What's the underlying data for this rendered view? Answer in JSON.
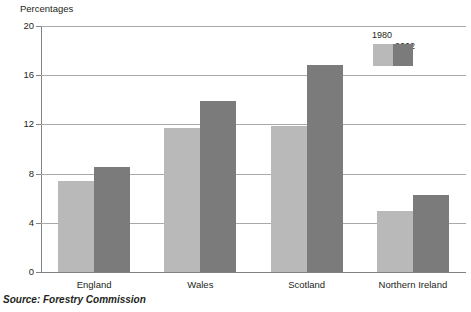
{
  "chart_data": {
    "type": "bar",
    "title": "",
    "subtitle": "",
    "axis_title": "Percentages",
    "xlabel": "",
    "ylabel": "Percentages",
    "ylim": [
      0,
      20
    ],
    "yticks": [
      0,
      4,
      8,
      12,
      16,
      20
    ],
    "ytick_labels": [
      "0",
      "4",
      "8",
      "12",
      "16",
      "20"
    ],
    "grid": true,
    "legend_position": "top-right",
    "categories": [
      "England",
      "Wales",
      "Scotland",
      "Northern Ireland"
    ],
    "series": [
      {
        "name": "1980",
        "color": "#b9b9b9",
        "values": [
          7.4,
          11.7,
          11.9,
          5.0
        ]
      },
      {
        "name": "2002",
        "color": "#7b7b7b",
        "values": [
          8.5,
          13.9,
          16.8,
          6.3
        ]
      }
    ],
    "source": "Source: Forestry Commission"
  },
  "colors": {
    "series_1980": "#b9b9b9",
    "series_2002": "#7b7b7b",
    "gridline": "#a7a9ac",
    "axis": "#808285",
    "text": "#231f20",
    "background": "#ffffff"
  }
}
